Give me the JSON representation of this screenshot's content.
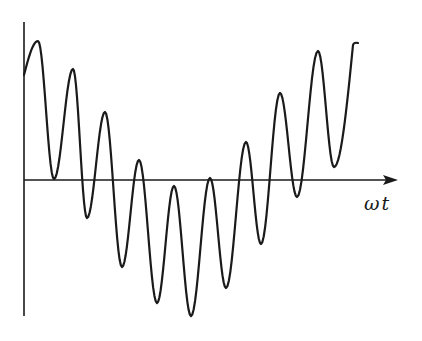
{
  "figure": {
    "x_axis_label": "ωt",
    "colors": {
      "stroke": "#1a1a1a",
      "background": "#ffffff"
    },
    "axes": {
      "origin": [
        24,
        180
      ],
      "y_axis": {
        "x": 24,
        "y_top": 22,
        "y_bottom": 316
      },
      "x_axis": {
        "y": 180,
        "x_start": 24,
        "x_end": 398,
        "arrow": true
      }
    },
    "curve_extrema": [
      {
        "kind": "start",
        "x": 24,
        "y": 75
      },
      {
        "kind": "max",
        "x": 38,
        "y": 41
      },
      {
        "kind": "min",
        "x": 54,
        "y": 179
      },
      {
        "kind": "max",
        "x": 73,
        "y": 69
      },
      {
        "kind": "min",
        "x": 87,
        "y": 218
      },
      {
        "kind": "max",
        "x": 105,
        "y": 112
      },
      {
        "kind": "min",
        "x": 122,
        "y": 267
      },
      {
        "kind": "max",
        "x": 139,
        "y": 160
      },
      {
        "kind": "min",
        "x": 157,
        "y": 303
      },
      {
        "kind": "max",
        "x": 174,
        "y": 186
      },
      {
        "kind": "min",
        "x": 191,
        "y": 316
      },
      {
        "kind": "max",
        "x": 210,
        "y": 178
      },
      {
        "kind": "min",
        "x": 226,
        "y": 288
      },
      {
        "kind": "max",
        "x": 246,
        "y": 142
      },
      {
        "kind": "min",
        "x": 261,
        "y": 244
      },
      {
        "kind": "max",
        "x": 280,
        "y": 93
      },
      {
        "kind": "min",
        "x": 297,
        "y": 197
      },
      {
        "kind": "max",
        "x": 318,
        "y": 51
      },
      {
        "kind": "min",
        "x": 334,
        "y": 167
      },
      {
        "kind": "end",
        "x": 353,
        "y": 45
      }
    ]
  }
}
